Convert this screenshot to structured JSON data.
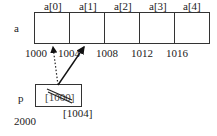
{
  "array": {
    "name": "a",
    "index_labels": [
      "a[0]",
      "a[1]",
      "a[2]",
      "a[3]",
      "a[4]"
    ],
    "addresses": [
      "1000",
      "1004",
      "1008",
      "1012",
      "1016"
    ]
  },
  "pointer": {
    "name": "p",
    "address": "2000",
    "old_value": "[1000]",
    "new_value": "[1004]"
  },
  "arrows": [
    {
      "style": "dotted",
      "from": "p",
      "to": "a[0]",
      "meaning": "old pointer target (1000)"
    },
    {
      "style": "solid",
      "from": "p",
      "to": "a[1]",
      "meaning": "new pointer target (1004)"
    }
  ]
}
